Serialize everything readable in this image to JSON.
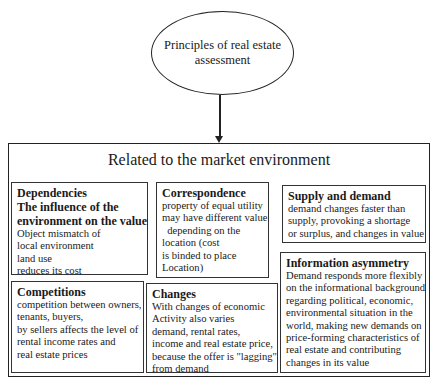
{
  "top": {
    "label": "Principles of real estate assessment"
  },
  "group": {
    "title": "Related to the market environment"
  },
  "boxes": {
    "dependencies": {
      "title_lines": [
        "Dependencies",
        "The influence of the",
        "environment on the value"
      ],
      "body_lines": [
        "Object mismatch of",
        "local environment",
        "land use",
        "reduces its cost"
      ]
    },
    "correspondence": {
      "title_lines": [
        "Correspondence"
      ],
      "body_lines": [
        "property of equal utility",
        "may have different value",
        "  depending on the",
        "location (cost",
        "is binded to place",
        "Location)"
      ]
    },
    "supply": {
      "title_lines": [
        "Supply and demand"
      ],
      "body_lines": [
        "demand changes faster than",
        "supply, provoking a shortage",
        "or surplus, and changes in value"
      ]
    },
    "information": {
      "title_lines": [
        "Information asymmetry"
      ],
      "body_lines": [
        "Demand responds more flexibly",
        "on the informational background",
        "regarding political, economic,",
        "environmental situation in the",
        "world, making new demands on",
        "price-forming characteristics of",
        "real estate and contributing",
        "changes in its value"
      ]
    },
    "competitions": {
      "title_lines": [
        "Competitions"
      ],
      "body_lines": [
        "competition between owners,",
        "tenants, buyers,",
        "by sellers affects the level of",
        "rental income rates and",
        "real estate prices"
      ]
    },
    "changes": {
      "title_lines": [
        "Changes"
      ],
      "body_lines": [
        "With changes of economic",
        "Activity also varies",
        "demand, rental rates,",
        "income and real estate price,",
        "because the offer is \"lagging\"",
        "from demand"
      ]
    }
  }
}
